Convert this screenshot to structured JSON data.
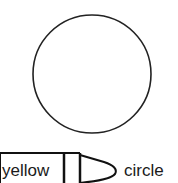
{
  "worksheet": {
    "shape": {
      "name": "circle",
      "stroke_color": "#222222"
    },
    "crayon": {
      "color_word": "yellow",
      "outline_color": "#111111"
    },
    "shape_word": "circle"
  }
}
